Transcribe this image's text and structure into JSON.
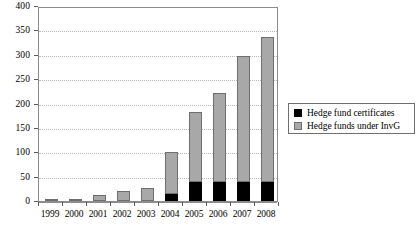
{
  "chart_data": {
    "type": "bar",
    "stacked": true,
    "title": "",
    "subtitle": "",
    "xlabel": "",
    "ylabel": "",
    "categories": [
      "1999",
      "2000",
      "2001",
      "2002",
      "2003",
      "2004",
      "2005",
      "2006",
      "2007",
      "2008"
    ],
    "series": [
      {
        "name": "Hedge fund certificates",
        "color": "#000000",
        "values": [
          0,
          0,
          0,
          0,
          0,
          15,
          40,
          40,
          40,
          40
        ]
      },
      {
        "name": "Hedge funds under InvG",
        "color": "#a8a8a8",
        "values": [
          1,
          2,
          13,
          20,
          27,
          85,
          143,
          182,
          258,
          297
        ]
      }
    ],
    "totals": [
      1,
      2,
      13,
      20,
      27,
      100,
      183,
      222,
      298,
      337
    ],
    "ylim": [
      0,
      400
    ],
    "yticks": [
      0,
      50,
      100,
      150,
      200,
      250,
      300,
      350,
      400
    ],
    "ytick_labels": [
      "0",
      "50",
      "100",
      "150",
      "200",
      "250",
      "300",
      "350",
      "400"
    ],
    "grid": true,
    "grid_axis": "y",
    "legend_position": "right-middle"
  },
  "legend": {
    "entries": [
      {
        "label": "Hedge fund certificates",
        "swatch": "black-square-swatch"
      },
      {
        "label": "Hedge funds under InvG",
        "swatch": "gray-square-swatch"
      }
    ]
  }
}
